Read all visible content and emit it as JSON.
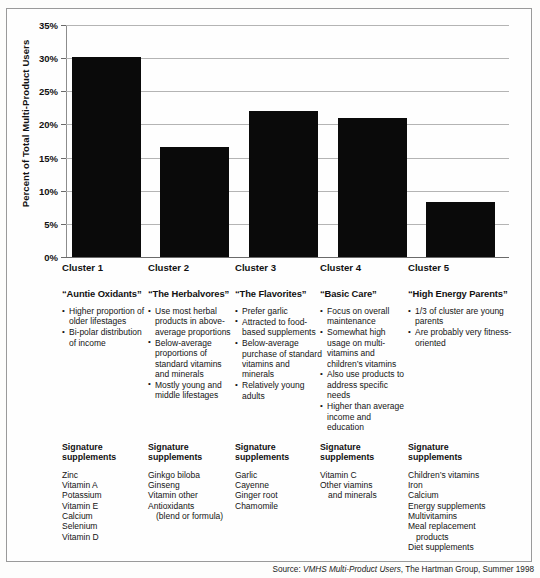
{
  "chart_data": {
    "type": "bar",
    "title": "",
    "xlabel": "",
    "ylabel": "Percent of Total Multi-Product Users",
    "categories": [
      "Cluster 1",
      "Cluster 2",
      "Cluster 3",
      "Cluster 4",
      "Cluster 5"
    ],
    "values": [
      30.2,
      16.6,
      22.1,
      20.9,
      8.3
    ],
    "ylim": [
      0,
      35
    ],
    "ytick_labels": [
      "0%",
      "5%",
      "10%",
      "15%",
      "20%",
      "25%",
      "30%",
      "35%"
    ],
    "ytick_values": [
      0,
      5,
      10,
      15,
      20,
      25,
      30,
      35
    ],
    "grid": true,
    "legend": "none",
    "bar_color": "#0a0a0a"
  },
  "clusters": [
    {
      "name": "Cluster 1",
      "nickname": "“Auntie Oxidants”",
      "bullets": [
        "Higher proportion of older lifestages",
        "Bi-polar distribution of income"
      ],
      "signature_title": "Signature supplements",
      "supplements": [
        {
          "text": "Zinc",
          "indent": false
        },
        {
          "text": "Vitamin A",
          "indent": false
        },
        {
          "text": "Potassium",
          "indent": false
        },
        {
          "text": "Vitamin E",
          "indent": false
        },
        {
          "text": "Calcium",
          "indent": false
        },
        {
          "text": "Selenium",
          "indent": false
        },
        {
          "text": "Vitamin D",
          "indent": false
        }
      ]
    },
    {
      "name": "Cluster 2",
      "nickname": "“The Herbalvores”",
      "bullets": [
        "Use most herbal products in above-average proportions",
        "Below-average proportions of standard vitamins and minerals",
        "Mostly young and middle lifestages"
      ],
      "signature_title": "Signature supplements",
      "supplements": [
        {
          "text": "Ginkgo biloba",
          "indent": false
        },
        {
          "text": "Ginseng",
          "indent": false
        },
        {
          "text": "Vitamin other",
          "indent": false
        },
        {
          "text": "Antioxidants",
          "indent": false
        },
        {
          "text": "(blend or formula)",
          "indent": true
        }
      ]
    },
    {
      "name": "Cluster 3",
      "nickname": "“The Flavorites”",
      "bullets": [
        "Prefer garlic",
        "Attracted to food-based supplements",
        "Below-average purchase of standard vitamins and minerals",
        "Relatively young adults"
      ],
      "signature_title": "Signature supplements",
      "supplements": [
        {
          "text": "Garlic",
          "indent": false
        },
        {
          "text": "Cayenne",
          "indent": false
        },
        {
          "text": "Ginger root",
          "indent": false
        },
        {
          "text": "Chamomile",
          "indent": false
        }
      ]
    },
    {
      "name": "Cluster 4",
      "nickname": "“Basic Care”",
      "bullets": [
        "Focus on overall maintenance",
        "Somewhat high usage on multi-vitamins and children’s vitamins",
        "Also use products to address specific needs",
        "Higher than average income and education"
      ],
      "signature_title": "Signature supplements",
      "supplements": [
        {
          "text": "Vitamin C",
          "indent": false
        },
        {
          "text": "Other viamins",
          "indent": false
        },
        {
          "text": "and minerals",
          "indent": true
        }
      ]
    },
    {
      "name": "Cluster 5",
      "nickname": "“High Energy Parents”",
      "bullets": [
        "1/3 of cluster are young parents",
        "Are probably very fitness-oriented"
      ],
      "signature_title": "Signature supplements",
      "supplements": [
        {
          "text": "Children’s vitamins",
          "indent": false
        },
        {
          "text": "Iron",
          "indent": false
        },
        {
          "text": "Calcium",
          "indent": false
        },
        {
          "text": "Energy supplements",
          "indent": false
        },
        {
          "text": "Multivitamins",
          "indent": false
        },
        {
          "text": "Meal replacement",
          "indent": false
        },
        {
          "text": "products",
          "indent": true
        },
        {
          "text": "Diet supplements",
          "indent": false
        }
      ]
    }
  ],
  "footer": {
    "source_prefix": "Source:",
    "source_italic": "VMHS Multi-Product Users",
    "source_rest": ", The Hartman Group, Summer 1998"
  }
}
